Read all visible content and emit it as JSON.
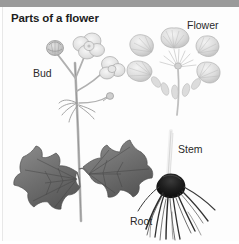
{
  "page": {
    "title": "Parts of a flower",
    "background_color": "#fdfdfd",
    "top_bar_color": "#9a9a9a"
  },
  "labels": {
    "flower": "Flower",
    "bud": "Bud",
    "stem": "Stem",
    "root": "Root"
  },
  "illustration": {
    "style": "grayscale botanical pencil drawing",
    "subject": "buttercup plant",
    "parts": [
      {
        "name": "bud",
        "label": "Bud",
        "description": "unopened flower bud on slender stalk, upper left of plant"
      },
      {
        "name": "flower",
        "label": "Flower",
        "description": "dissected flower with six petals arranged radially around receptacle with stamens"
      },
      {
        "name": "stem",
        "label": "Stem",
        "description": "pale vertical stem above root specimen"
      },
      {
        "name": "root",
        "label": "Root",
        "description": "dark fibrous root system"
      },
      {
        "name": "leaves",
        "label": "",
        "description": "two deeply lobed palmate leaves on the main stem"
      }
    ],
    "ink_color": "#6e6e6e",
    "root_color": "#2b2b2b",
    "petal_color": "#d8d8d8"
  }
}
